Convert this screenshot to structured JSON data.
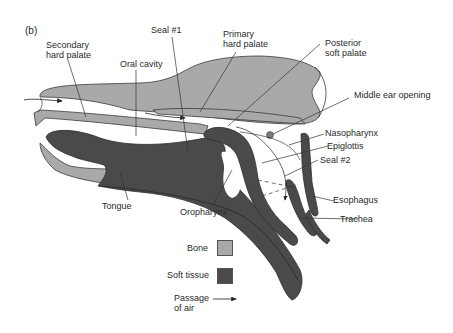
{
  "figure": {
    "panel_label": "(b)",
    "colors": {
      "bone": "#a9a9a9",
      "soft_tissue": "#4a4a4a",
      "outline": "#3a3a3a",
      "leader": "#333333"
    },
    "labels": {
      "secondary_hard_palate_1": "Secondary",
      "secondary_hard_palate_2": "hard palate",
      "oral_cavity": "Oral cavity",
      "seal_1": "Seal #1",
      "primary_hard_palate_1": "Primary",
      "primary_hard_palate_2": "hard palate",
      "posterior_soft_palate_1": "Posterior",
      "posterior_soft_palate_2": "soft palate",
      "middle_ear_opening": "Middle ear opening",
      "nasopharynx": "Nasopharynx",
      "epiglottis": "Epiglottis",
      "seal_2": "Seal #2",
      "esophagus": "Esophagus",
      "trachea": "Trachea",
      "tongue": "Tongue",
      "oropharynx": "Oropharynx"
    },
    "legend": {
      "items": [
        {
          "label": "Bone",
          "type": "swatch",
          "color": "#a9a9a9"
        },
        {
          "label": "Soft tissue",
          "type": "swatch",
          "color": "#4a4a4a"
        },
        {
          "label_1": "Passage",
          "label_2": "of air",
          "type": "arrow"
        }
      ]
    }
  }
}
